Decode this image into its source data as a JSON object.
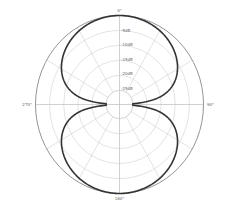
{
  "chart_data": {
    "type": "polar",
    "title": "",
    "pattern": "figure-8 (bidirectional)",
    "angle_labels": [
      "0°",
      "90°",
      "180°",
      "270°"
    ],
    "angle_label_positions_deg": [
      0,
      90,
      180,
      270
    ],
    "radial_gridline_step_deg": 30,
    "ring_labels": [
      "-5dB",
      "-10dB",
      "-15dB",
      "-20dB",
      "-25dB"
    ],
    "ring_values_db": [
      0,
      -5,
      -10,
      -15,
      -20,
      -25
    ],
    "r_range_db": [
      -25,
      0
    ],
    "theta_deg": [
      0,
      15,
      30,
      45,
      60,
      75,
      85,
      90,
      95,
      105,
      120,
      135,
      150,
      165,
      180,
      195,
      210,
      225,
      240,
      255,
      265,
      270,
      275,
      285,
      300,
      315,
      330,
      345
    ],
    "values_db": [
      0,
      -0.3,
      -1.25,
      -3.0,
      -6.0,
      -11.7,
      -21.2,
      -25,
      -21.2,
      -11.7,
      -6.0,
      -3.0,
      -1.25,
      -0.3,
      0,
      -0.3,
      -1.25,
      -3.0,
      -6.0,
      -11.7,
      -21.2,
      -25,
      -21.2,
      -11.7,
      -6.0,
      -3.0,
      -1.25,
      -0.3
    ],
    "grid": true,
    "legend": null,
    "colors": {
      "curve": "#333333",
      "outer_circle": "#888888",
      "grid": "#d0d0d0",
      "background": "#ffffff"
    }
  },
  "labels": {
    "top": "0°",
    "right": "90°",
    "bottom": "180°",
    "left": "270°",
    "ring_1": "-5dB",
    "ring_2": "-10dB",
    "ring_3": "-15dB",
    "ring_4": "-20dB",
    "ring_5": "-25dB"
  }
}
